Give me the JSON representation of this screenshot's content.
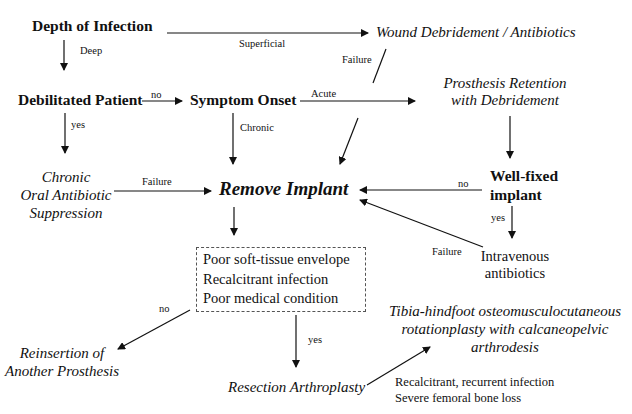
{
  "nodes": {
    "depth": "Depth of Infection",
    "wound": "Wound Debridement / Antibiotics",
    "debilitated": "Debilitated Patient",
    "onset": "Symptom Onset",
    "retention_1": "Prosthesis Retention",
    "retention_2": "with Debridement",
    "chronic_1": "Chronic",
    "chronic_2": "Oral Antibiotic",
    "chronic_3": "Suppression",
    "remove": "Remove Implant",
    "wellfixed_1": "Well-fixed",
    "wellfixed_2": "implant",
    "iv_1": "Intravenous",
    "iv_2": "antibiotics",
    "criteria": [
      "Poor soft-tissue envelope",
      "Recalcitrant infection",
      "Poor medical condition"
    ],
    "rotation_1": "Tibia-hindfoot osteomusculocutaneous",
    "rotation_2": "rotationplasty with calcaneopelvic",
    "rotation_3": "arthrodesis",
    "reinsertion_1": "Reinsertion of",
    "reinsertion_2": "Another Prosthesis",
    "resection": "Resection Arthroplasty",
    "indications": [
      "Recalcitrant, recurrent infection",
      "Severe femoral bone loss"
    ]
  },
  "edge_labels": {
    "deep": "Deep",
    "superficial": "Superficial",
    "failure_wound": "Failure",
    "no_debilitated": "no",
    "acute": "Acute",
    "yes_debilitated": "yes",
    "chronic": "Chronic",
    "failure_oral": "Failure",
    "no_wellfixed": "no",
    "yes_wellfixed": "yes",
    "failure_iv": "Failure",
    "no_criteria": "no",
    "yes_criteria": "yes"
  }
}
